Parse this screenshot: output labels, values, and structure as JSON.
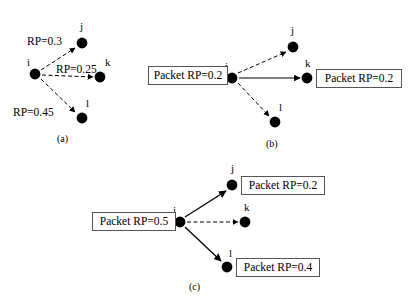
{
  "figure": {
    "title": "",
    "panels": [
      {
        "id": "a",
        "caption": "(a)",
        "nodes": [
          {
            "name": "i",
            "label": "i",
            "x": 35,
            "y": 74
          },
          {
            "name": "j",
            "label": "j",
            "x": 82,
            "y": 43
          },
          {
            "name": "k",
            "label": "k",
            "x": 100,
            "y": 77
          },
          {
            "name": "l",
            "label": "l",
            "x": 82,
            "y": 118
          }
        ],
        "edges": [
          {
            "from": "i",
            "to": "j",
            "style": "dashed",
            "label": "RP=0.3"
          },
          {
            "from": "i",
            "to": "k",
            "style": "dashed",
            "label": "RP=0.25"
          },
          {
            "from": "i",
            "to": "l",
            "style": "dashed",
            "label": "RP=0.45"
          }
        ],
        "boxes": []
      },
      {
        "id": "b",
        "caption": "(b)",
        "nodes": [
          {
            "name": "i",
            "label": "i",
            "x": 232,
            "y": 78
          },
          {
            "name": "j",
            "label": "j",
            "x": 293,
            "y": 47
          },
          {
            "name": "k",
            "label": "k",
            "x": 307,
            "y": 78
          },
          {
            "name": "l",
            "label": "l",
            "x": 275,
            "y": 122
          }
        ],
        "edges": [
          {
            "from": "i",
            "to": "j",
            "style": "dashed",
            "label": ""
          },
          {
            "from": "i",
            "to": "k",
            "style": "solid",
            "label": ""
          },
          {
            "from": "i",
            "to": "l",
            "style": "dashed",
            "label": ""
          }
        ],
        "boxes": [
          {
            "name": "packet-box-source",
            "text": "Packet RP=0.2"
          },
          {
            "name": "packet-box-k",
            "text": "Packet RP=0.2"
          }
        ]
      },
      {
        "id": "c",
        "caption": "(c)",
        "nodes": [
          {
            "name": "i",
            "label": "i",
            "x": 180,
            "y": 222
          },
          {
            "name": "j",
            "label": "j",
            "x": 232,
            "y": 185
          },
          {
            "name": "k",
            "label": "k",
            "x": 245,
            "y": 222
          },
          {
            "name": "l",
            "label": "l",
            "x": 227,
            "y": 267
          }
        ],
        "edges": [
          {
            "from": "i",
            "to": "j",
            "style": "solid",
            "label": ""
          },
          {
            "from": "i",
            "to": "k",
            "style": "dashed",
            "label": ""
          },
          {
            "from": "i",
            "to": "l",
            "style": "solid",
            "label": ""
          }
        ],
        "boxes": [
          {
            "name": "packet-box-source",
            "text": "Packet RP=0.5"
          },
          {
            "name": "packet-box-j",
            "text": "Packet RP=0.2"
          },
          {
            "name": "packet-box-l",
            "text": "Packet RP=0.4"
          }
        ]
      }
    ],
    "colors": {
      "node": "#000000",
      "edge": "#000000",
      "box_border": "#555555",
      "background": "#ffffff",
      "text": "#000000"
    }
  }
}
